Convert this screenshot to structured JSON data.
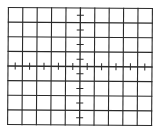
{
  "graticule": {
    "type": "oscilloscope-graticule",
    "columns": 10,
    "rows": 8,
    "left": 8,
    "top": 8,
    "right": 152,
    "bottom": 125,
    "line_color": "#2a2a2a",
    "background": "#ffffff",
    "grid_line_width": 1.1,
    "axis_line_width": 1.3,
    "minor_ticks_per_division": 2,
    "tick_half_length": 3,
    "rotation_deg": 0.4
  }
}
